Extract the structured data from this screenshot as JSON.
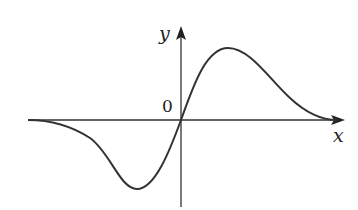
{
  "figure": {
    "x_axis_label": "x",
    "y_axis_label": "y",
    "origin_label": "0",
    "curve_description": "odd function: near zero at left, dips to a minimum left of origin, passes through origin, peaks right of origin, decays to zero at right",
    "colors": {
      "axis": "#333333",
      "curve": "#333333",
      "background": "#ffffff"
    }
  }
}
